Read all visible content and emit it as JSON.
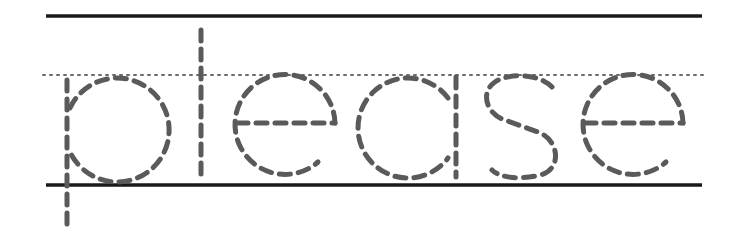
{
  "worksheet": {
    "word": "please",
    "letters": [
      "p",
      "l",
      "e",
      "a",
      "s",
      "e"
    ],
    "colors": {
      "background": "#ffffff",
      "guide_line": "#1a1a1a",
      "midline_dots": "#6a6a6a",
      "trace_dashes": "#5a5a5a"
    },
    "guides": {
      "top_line_y": 16,
      "midline_y": 75,
      "baseline_y": 185,
      "x_start": 46,
      "x_end": 702
    }
  }
}
